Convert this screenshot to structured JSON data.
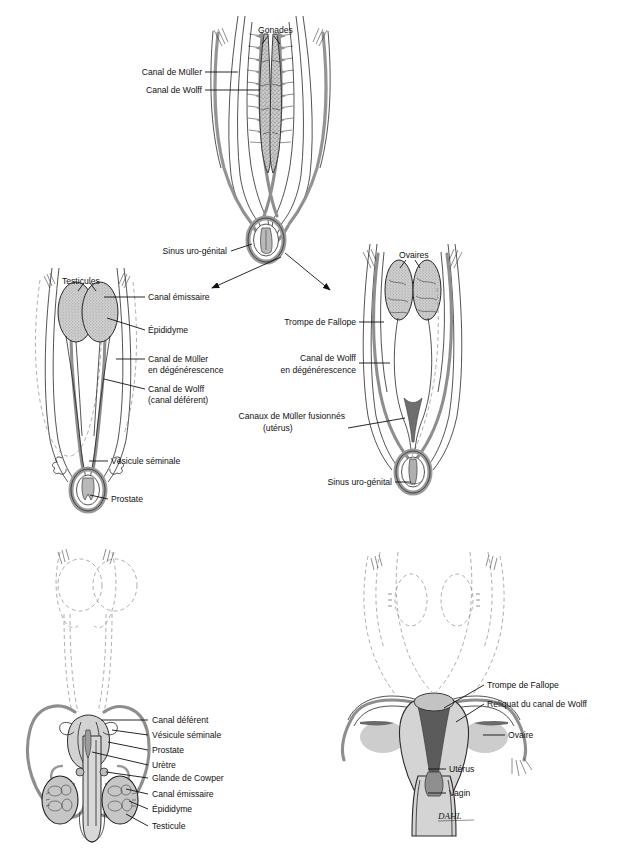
{
  "document": {
    "title": "Différenciation sexuelle embryonnaire",
    "background_color": "#ffffff",
    "signature": "DAHL"
  },
  "palette": {
    "ink": "#111111",
    "duct_gray": "#8e8e8e",
    "gonad_fill": "#c9c9c9",
    "organ_light": "#d8d8d8",
    "organ_mid": "#b4b4b4",
    "organ_dark": "#6e6e6e",
    "dashed_gray": "#8d8d8d"
  },
  "panels": [
    {
      "id": "indifferent",
      "name": "stade-indifferencie",
      "labels": [
        {
          "id": "gonades",
          "text": "Gonades",
          "x": 258,
          "y": 33,
          "align": "start"
        },
        {
          "id": "canal-muller",
          "text": "Canal de Müller",
          "x": 202,
          "y": 75,
          "align": "end"
        },
        {
          "id": "canal-wolff",
          "text": "Canal de Wolff",
          "x": 202,
          "y": 93,
          "align": "end"
        },
        {
          "id": "sinus",
          "text": "Sinus uro-génital",
          "x": 227,
          "y": 254,
          "align": "end"
        }
      ]
    },
    {
      "id": "male-embryo",
      "name": "differenciation-male",
      "labels": [
        {
          "id": "testicules",
          "text": "Testicules",
          "x": 62,
          "y": 284,
          "align": "start"
        },
        {
          "id": "canal-emiss",
          "text": "Canal émissaire",
          "x": 148,
          "y": 300,
          "align": "start"
        },
        {
          "id": "epididyme",
          "text": "Épididyme",
          "x": 148,
          "y": 333,
          "align": "start"
        },
        {
          "id": "muller-deg1",
          "text": "Canal de Müller",
          "x": 148,
          "y": 362,
          "align": "start"
        },
        {
          "id": "muller-deg2",
          "text": "en dégénérescence",
          "x": 148,
          "y": 373,
          "align": "start"
        },
        {
          "id": "wolff-def1",
          "text": "Canal de Wolff",
          "x": 148,
          "y": 392,
          "align": "start"
        },
        {
          "id": "wolff-def2",
          "text": "(canal déférent)",
          "x": 148,
          "y": 403,
          "align": "start"
        },
        {
          "id": "vesicule",
          "text": "Vésicule séminale",
          "x": 111,
          "y": 464,
          "align": "start"
        },
        {
          "id": "prostate",
          "text": "Prostate",
          "x": 111,
          "y": 502,
          "align": "start"
        }
      ]
    },
    {
      "id": "female-embryo",
      "name": "differenciation-femelle",
      "labels": [
        {
          "id": "ovaires",
          "text": "Ovaires",
          "x": 399,
          "y": 258,
          "align": "start"
        },
        {
          "id": "trompe",
          "text": "Trompe de Fallope",
          "x": 356,
          "y": 325,
          "align": "end"
        },
        {
          "id": "wolff-deg1",
          "text": "Canal de Wolff",
          "x": 356,
          "y": 361,
          "align": "end"
        },
        {
          "id": "wolff-deg2",
          "text": "en dégénérescence",
          "x": 356,
          "y": 373,
          "align": "end"
        },
        {
          "id": "uterus1",
          "text": "Canaux de Müller fusionnés",
          "x": 345,
          "y": 419,
          "align": "end"
        },
        {
          "id": "uterus2",
          "text": "(utérus)",
          "x": 263,
          "y": 431,
          "align": "start"
        },
        {
          "id": "sinus-f",
          "text": "Sinus uro-génital",
          "x": 392,
          "y": 485,
          "align": "end"
        }
      ]
    },
    {
      "id": "male-adult",
      "name": "appareil-genital-male-adulte",
      "labels": [
        {
          "id": "canal-deferent",
          "text": "Canal déférent",
          "x": 152,
          "y": 723,
          "align": "start"
        },
        {
          "id": "vesicule-sem",
          "text": "Vésicule séminale",
          "x": 152,
          "y": 738,
          "align": "start"
        },
        {
          "id": "prostate-a",
          "text": "Prostate",
          "x": 152,
          "y": 753,
          "align": "start"
        },
        {
          "id": "uretre",
          "text": "Urètre",
          "x": 152,
          "y": 768,
          "align": "start"
        },
        {
          "id": "cowper",
          "text": "Glande de Cowper",
          "x": 152,
          "y": 781,
          "align": "start"
        },
        {
          "id": "canal-emiss-a",
          "text": "Canal émissaire",
          "x": 152,
          "y": 797,
          "align": "start"
        },
        {
          "id": "epididyme-a",
          "text": "Épididyme",
          "x": 152,
          "y": 812,
          "align": "start"
        },
        {
          "id": "testicule-a",
          "text": "Testicule",
          "x": 152,
          "y": 829,
          "align": "start"
        }
      ]
    },
    {
      "id": "female-adult",
      "name": "appareil-genital-femelle-adulte",
      "labels": [
        {
          "id": "trompe-a",
          "text": "Trompe de Fallope",
          "x": 487,
          "y": 688,
          "align": "start"
        },
        {
          "id": "reliquat",
          "text": "Reliquat du canal de Wolff",
          "x": 487,
          "y": 707,
          "align": "start"
        },
        {
          "id": "ovaire-a",
          "text": "Ovaire",
          "x": 508,
          "y": 738,
          "align": "start"
        },
        {
          "id": "uterus-a",
          "text": "Utérus",
          "x": 449,
          "y": 772,
          "align": "start"
        },
        {
          "id": "vagin-a",
          "text": "Vagin",
          "x": 449,
          "y": 796,
          "align": "start"
        }
      ]
    }
  ]
}
